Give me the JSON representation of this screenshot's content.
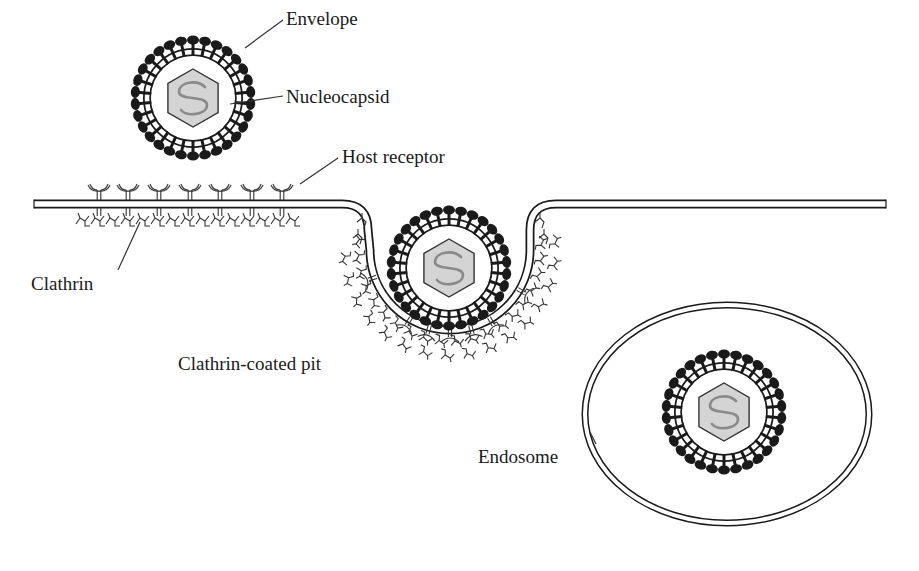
{
  "labels": {
    "envelope": "Envelope",
    "nucleocapsid": "Nucleocapsid",
    "host_receptor": "Host receptor",
    "clathrin": "Clathrin",
    "clathrin_coated_pit": "Clathrin-coated pit",
    "endosome": "Endosome"
  },
  "colors": {
    "background": "#ffffff",
    "outline": "#1a1a1a",
    "spike": "#1a1a1a",
    "nucleocapsid_fill": "#d4d4d4",
    "genome": "#8a8a8a"
  },
  "virions": [
    {
      "id": "free",
      "cx": 193,
      "cy": 98,
      "r": 70
    },
    {
      "id": "pit",
      "cx": 449,
      "cy": 268,
      "r": 70
    },
    {
      "id": "endosome",
      "cx": 724,
      "cy": 412,
      "r": 70
    }
  ],
  "endosome": {
    "cx": 727,
    "cy": 414,
    "rx": 142,
    "ry": 109
  }
}
